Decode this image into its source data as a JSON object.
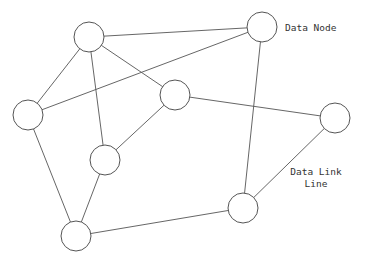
{
  "diagram": {
    "type": "network-graph",
    "labels": {
      "node_label": "Data Node",
      "link_label_line1": "Data Link",
      "link_label_line2": "Line"
    },
    "node_radius": 15,
    "nodes": [
      {
        "id": "n1",
        "x": 89,
        "y": 37
      },
      {
        "id": "n2",
        "x": 262,
        "y": 27
      },
      {
        "id": "n3",
        "x": 28,
        "y": 115
      },
      {
        "id": "n4",
        "x": 175,
        "y": 95
      },
      {
        "id": "n5",
        "x": 335,
        "y": 118
      },
      {
        "id": "n6",
        "x": 105,
        "y": 160
      },
      {
        "id": "n7",
        "x": 243,
        "y": 208
      },
      {
        "id": "n8",
        "x": 76,
        "y": 236
      }
    ],
    "links": [
      [
        "n1",
        "n2"
      ],
      [
        "n1",
        "n3"
      ],
      [
        "n1",
        "n6"
      ],
      [
        "n1",
        "n4"
      ],
      [
        "n3",
        "n2"
      ],
      [
        "n3",
        "n8"
      ],
      [
        "n4",
        "n6"
      ],
      [
        "n4",
        "n5"
      ],
      [
        "n2",
        "n7"
      ],
      [
        "n5",
        "n7"
      ],
      [
        "n6",
        "n8"
      ],
      [
        "n8",
        "n7"
      ]
    ],
    "colors": {
      "stroke": "#555555",
      "background": "#ffffff",
      "text": "#333333"
    }
  }
}
